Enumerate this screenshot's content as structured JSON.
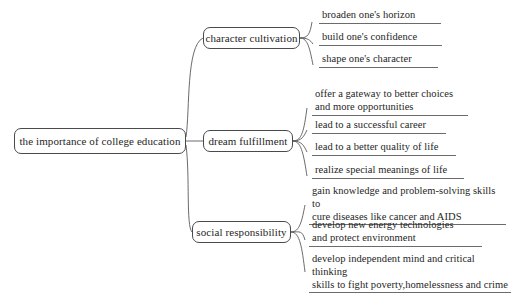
{
  "diagram": {
    "type": "mind-map",
    "root": {
      "label": "the importance of college education"
    },
    "branches": [
      {
        "label": "character cultivation",
        "leaves": [
          {
            "text": "broaden one's horizon"
          },
          {
            "text": "build one's confidence"
          },
          {
            "text": "shape one's character"
          }
        ]
      },
      {
        "label": "dream fulfillment",
        "leaves": [
          {
            "text": "offer a gateway to better choices\nand more opportunities"
          },
          {
            "text": "lead to a successful career"
          },
          {
            "text": "lead to a better quality of life"
          },
          {
            "text": "realize special meanings of life"
          }
        ]
      },
      {
        "label": "social responsibility",
        "leaves": [
          {
            "text": "gain knowledge and problem-solving skills to\ncure diseases like cancer and AIDS"
          },
          {
            "text": "develop new energy technologies\nand protect environment"
          },
          {
            "text": "develop independent mind and critical thinking\nskills to fight poverty,homelessness and crime"
          }
        ]
      }
    ],
    "colors": {
      "background": "#ffffff",
      "text": "#262626",
      "node_border": "#4a4a4a",
      "connector": "#5a5a5a",
      "underline": "#6b6b6b"
    }
  }
}
